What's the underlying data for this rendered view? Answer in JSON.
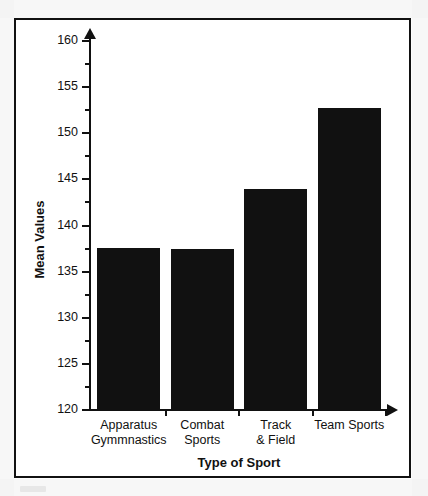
{
  "chart_data": {
    "type": "bar",
    "title": "",
    "subtitle": "",
    "xlabel": "Type of Sport",
    "ylabel": "Mean Values",
    "categories": [
      "Apparatus Gymmnastics",
      "Combat Sports",
      "Track & Field",
      "Team Sports"
    ],
    "category_lines": [
      [
        "Apparatus",
        "Gymmnastics"
      ],
      [
        "Combat",
        "Sports"
      ],
      [
        "Track",
        "& Field"
      ],
      [
        "Team Sports",
        ""
      ]
    ],
    "values": [
      137.6,
      137.5,
      144.0,
      152.7
    ],
    "ylim": [
      120,
      160
    ],
    "ytick_labels": [
      "120",
      "125",
      "130",
      "135",
      "140",
      "145",
      "150",
      "155",
      "160"
    ],
    "ytick_values": [
      120,
      125,
      130,
      135,
      140,
      145,
      150,
      155,
      160
    ],
    "yminor_values": [
      122.5,
      127.5,
      132.5,
      137.5,
      142.5,
      147.5,
      152.5,
      157.5
    ],
    "ytick_step": 5,
    "yminor_step": 2.5,
    "grid": false,
    "legend": "none",
    "bar_color": "#111111",
    "axis_color": "#111111",
    "background_color": "#ffffff",
    "y_axis_arrow": true,
    "x_axis_arrow": true
  },
  "figure": {
    "border_color": "#111111",
    "frame_style": "rectangle"
  }
}
